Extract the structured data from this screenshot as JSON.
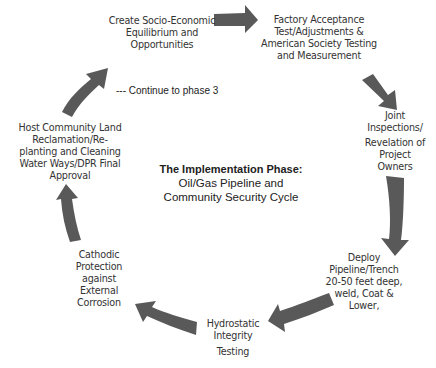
{
  "diagram": {
    "title": "The Implementation Phase:",
    "subtitle_line1": "Oil/Gas Pipeline and",
    "subtitle_line2": "Community Security Cycle",
    "arrow_color": "#595959",
    "note": "--- Continue to phase 3",
    "steps": [
      {
        "lines": [
          "Create Socio-Economic",
          "Equilibrium and",
          "Opportunities"
        ]
      },
      {
        "lines": [
          "Factory Acceptance",
          "Test/Adjustments &",
          "American Society Testing",
          "and Measurement"
        ]
      },
      {
        "lines": [
          "Joint",
          "Inspections/",
          "Revelation of",
          "Project",
          "Owners"
        ]
      },
      {
        "lines": [
          "Deploy",
          "Pipeline/Trench",
          "20-50 feet deep,",
          "weld, Coat &",
          "Lower,"
        ]
      },
      {
        "lines": [
          "Hydrostatic",
          "Integrity",
          "Testing"
        ]
      },
      {
        "lines": [
          "Cathodic",
          "Protection",
          "against",
          "External",
          "Corrosion"
        ]
      },
      {
        "lines": [
          "Host Community  Land",
          "Reclamation/Re-",
          "planting and Cleaning",
          "Water Ways/DPR Final",
          "Approval"
        ]
      }
    ]
  }
}
